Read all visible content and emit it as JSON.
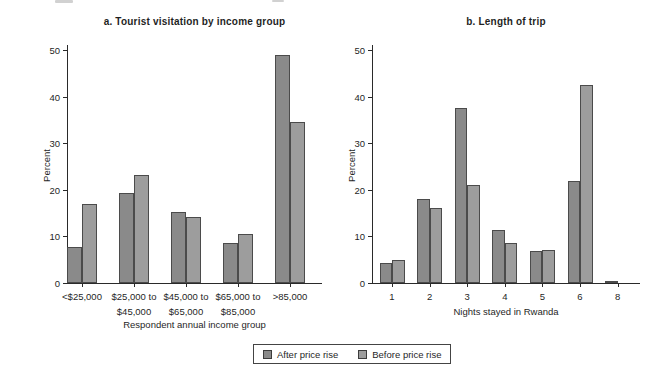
{
  "figure": {
    "legend": {
      "items": [
        {
          "label": "After price rise",
          "series_key": "after",
          "color": "#8a8a8a"
        },
        {
          "label": "Before price rise",
          "series_key": "before",
          "color": "#9d9d9d"
        }
      ]
    },
    "colors": {
      "after_bar": "#8a8a8a",
      "before_bar": "#9d9d9d",
      "bar_border": "#4b4b4b",
      "axis": "#2a2a2a",
      "text": "#1f1f1f",
      "background": "#ffffff"
    }
  },
  "chart_data": [
    {
      "id": "a",
      "type": "bar",
      "title": "a. Tourist visitation by income group",
      "xlabel": "Respondent annual income group",
      "ylabel": "Percent",
      "ylim": [
        0,
        50
      ],
      "yticks": [
        0,
        10,
        20,
        30,
        40,
        50
      ],
      "grid": false,
      "legend_position": "bottom-shared",
      "categories": [
        [
          "<$25,000"
        ],
        [
          "$25,000 to",
          "$45,000"
        ],
        [
          "$45,000 to",
          "$65,000"
        ],
        [
          "$65,000 to",
          "$85,000"
        ],
        [
          ">85,000"
        ]
      ],
      "series": [
        {
          "name": "After price rise",
          "values": [
            7.8,
            19.3,
            15.2,
            8.6,
            49.0
          ]
        },
        {
          "name": "Before price rise",
          "values": [
            17.0,
            23.2,
            14.2,
            10.6,
            34.6
          ]
        }
      ]
    },
    {
      "id": "b",
      "type": "bar",
      "title": "b. Length of trip",
      "xlabel": "Nights stayed in Rwanda",
      "ylabel": "Percent",
      "ylim": [
        0,
        50
      ],
      "yticks": [
        0,
        10,
        20,
        30,
        40,
        50
      ],
      "grid": false,
      "legend_position": "bottom-shared",
      "categories": [
        [
          "1"
        ],
        [
          "2"
        ],
        [
          "3"
        ],
        [
          "4"
        ],
        [
          "5"
        ],
        [
          "6"
        ],
        [
          "8"
        ]
      ],
      "series": [
        {
          "name": "After price rise",
          "values": [
            4.2,
            18.1,
            37.6,
            11.4,
            6.8,
            21.9,
            0.5
          ]
        },
        {
          "name": "Before price rise",
          "values": [
            5.0,
            16.1,
            21.0,
            8.6,
            7.0,
            42.5,
            0
          ]
        }
      ]
    }
  ]
}
